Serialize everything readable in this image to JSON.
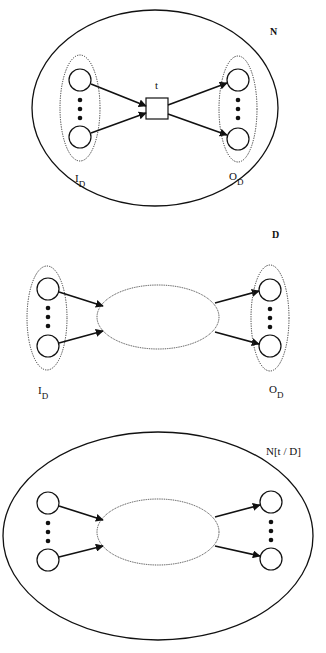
{
  "diagrams": [
    {
      "id": "N",
      "title": "N",
      "transition_label": "t",
      "input_set_label": "I",
      "input_set_sub": "D",
      "output_set_label": "O",
      "output_set_sub": "D"
    },
    {
      "id": "D",
      "title": "D",
      "input_set_label": "I",
      "input_set_sub": "D",
      "output_set_label": "O",
      "output_set_sub": "D"
    },
    {
      "id": "N[t / D]",
      "title": "N[t / D]"
    }
  ],
  "colors": {
    "stroke": "#111111",
    "background": "#ffffff"
  }
}
